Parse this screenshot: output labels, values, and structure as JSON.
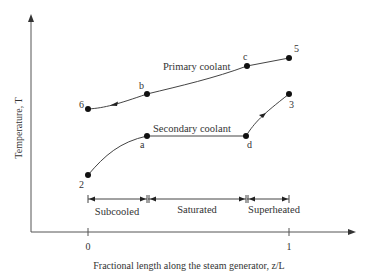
{
  "diagram": {
    "y_axis_title": "Temperature, T",
    "x_axis_title": "Fractional length along the steam generator, z/L",
    "x_ticks": [
      {
        "label": "0",
        "value": 0
      },
      {
        "label": "1",
        "value": 1
      }
    ],
    "curves": {
      "primary": {
        "label": "Primary coolant",
        "points": [
          {
            "label": "5",
            "z": 1.0
          },
          {
            "label": "c",
            "z": 0.79
          },
          {
            "label": "b",
            "z": 0.29
          },
          {
            "label": "6",
            "z": 0.0
          }
        ],
        "flow_direction": "right-to-left"
      },
      "secondary": {
        "label": "Secondary coolant",
        "points": [
          {
            "label": "2",
            "z": 0.0
          },
          {
            "label": "a",
            "z": 0.29
          },
          {
            "label": "d",
            "z": 0.79
          },
          {
            "label": "3",
            "z": 1.0
          }
        ],
        "flow_direction": "left-to-right"
      }
    },
    "regions": [
      {
        "label": "Subcooled",
        "from": 0.0,
        "to": 0.29
      },
      {
        "label": "Saturated",
        "from": 0.29,
        "to": 0.79
      },
      {
        "label": "Superheated",
        "from": 0.79,
        "to": 1.0
      }
    ],
    "colors": {
      "line": "#444444",
      "point": "#111111",
      "text": "#333333"
    }
  }
}
